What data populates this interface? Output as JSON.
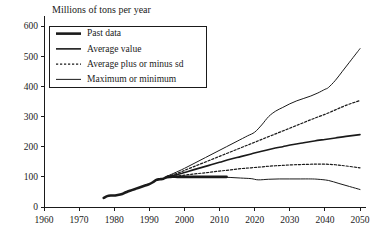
{
  "chart_data": {
    "type": "line",
    "title": "Millions of tons per year",
    "xlabel": "",
    "ylabel": "Millions of tons per year",
    "xlim": [
      1960,
      2050
    ],
    "ylim": [
      0,
      600
    ],
    "xticks": [
      1960,
      1970,
      1980,
      1990,
      2000,
      2010,
      2020,
      2030,
      2040,
      2050
    ],
    "yticks": [
      0,
      100,
      200,
      300,
      400,
      500,
      600
    ],
    "xtick_labels": [
      "1960",
      "1970",
      "1980",
      "1990",
      "2000",
      "2010",
      "2020",
      "2030",
      "2040",
      "2050"
    ],
    "ytick_labels": [
      "0",
      "100",
      "200",
      "300",
      "400",
      "500",
      "600"
    ],
    "grid": false,
    "legend_position": "top-left",
    "legend_entries": [
      {
        "label": "Past data",
        "style": "solid",
        "width": 2.6
      },
      {
        "label": "Average value",
        "style": "solid",
        "width": 1.6
      },
      {
        "label": "Average plus or minus sd",
        "style": "dashed",
        "width": 1.2
      },
      {
        "label": "Maximum or minimum",
        "style": "solid",
        "width": 1.0
      }
    ],
    "series": [
      {
        "name": "Past data",
        "style": "solid",
        "width": 2.6,
        "x": [
          1977,
          1978,
          1979,
          1980,
          1981,
          1982,
          1983,
          1984,
          1985,
          1986,
          1987,
          1988,
          1989,
          1990,
          1991,
          1992,
          1993,
          1994,
          1995,
          1996,
          1998,
          2000,
          2003,
          2006,
          2009,
          2012
        ],
        "values": [
          30,
          36,
          38,
          38,
          40,
          42,
          47,
          52,
          56,
          60,
          64,
          68,
          72,
          76,
          82,
          90,
          92,
          94,
          99,
          100,
          100,
          100,
          100,
          100,
          100,
          100
        ]
      },
      {
        "name": "Average value",
        "style": "solid",
        "width": 1.6,
        "x": [
          1995,
          1998,
          2001,
          2004,
          2007,
          2010,
          2013,
          2016,
          2019,
          2022,
          2025,
          2028,
          2031,
          2034,
          2037,
          2040,
          2043,
          2046,
          2050
        ],
        "values": [
          100,
          108,
          118,
          128,
          138,
          148,
          158,
          167,
          176,
          185,
          193,
          200,
          207,
          213,
          219,
          224,
          229,
          234,
          240
        ]
      },
      {
        "name": "Average plus sd",
        "style": "dashed",
        "width": 1.2,
        "x": [
          1995,
          1998,
          2001,
          2004,
          2007,
          2010,
          2013,
          2016,
          2019,
          2022,
          2025,
          2028,
          2031,
          2034,
          2037,
          2040,
          2043,
          2046,
          2050
        ],
        "values": [
          101,
          112,
          126,
          140,
          154,
          168,
          182,
          196,
          210,
          224,
          238,
          252,
          266,
          280,
          294,
          307,
          322,
          337,
          353
        ]
      },
      {
        "name": "Average minus sd",
        "style": "dashed",
        "width": 1.2,
        "x": [
          1995,
          1998,
          2001,
          2004,
          2007,
          2010,
          2013,
          2016,
          2019,
          2022,
          2025,
          2028,
          2031,
          2034,
          2037,
          2040,
          2043,
          2046,
          2050
        ],
        "values": [
          99,
          103,
          107,
          111,
          115,
          119,
          123,
          127,
          130,
          133,
          136,
          138,
          140,
          141,
          142,
          142,
          140,
          136,
          130
        ]
      },
      {
        "name": "Maximum",
        "style": "solid",
        "width": 1.0,
        "x": [
          1995,
          1997,
          2000,
          2003,
          2006,
          2009,
          2012,
          2015,
          2018,
          2020,
          2022,
          2024,
          2026,
          2028,
          2030,
          2032,
          2034,
          2036,
          2038,
          2040,
          2041,
          2043,
          2045,
          2047,
          2049,
          2050
        ],
        "values": [
          102,
          112,
          128,
          146,
          164,
          182,
          200,
          218,
          236,
          248,
          272,
          300,
          318,
          330,
          342,
          352,
          360,
          368,
          378,
          390,
          396,
          420,
          450,
          480,
          510,
          525
        ]
      },
      {
        "name": "Minimum",
        "style": "solid",
        "width": 1.0,
        "x": [
          1995,
          1998,
          2001,
          2004,
          2007,
          2010,
          2013,
          2016,
          2019,
          2021,
          2024,
          2027,
          2030,
          2033,
          2036,
          2038,
          2041,
          2044,
          2047,
          2050
        ],
        "values": [
          99,
          99,
          99,
          99,
          99,
          99,
          98,
          96,
          94,
          90,
          92,
          93,
          93,
          93,
          93,
          92,
          88,
          78,
          68,
          58
        ]
      }
    ]
  },
  "plot_geometry": {
    "left": 44,
    "right": 360,
    "top": 26,
    "bottom": 207,
    "title_x": 52,
    "title_y": 13,
    "legend": {
      "x": 49,
      "y": 26,
      "width": 157,
      "height": 61
    }
  }
}
